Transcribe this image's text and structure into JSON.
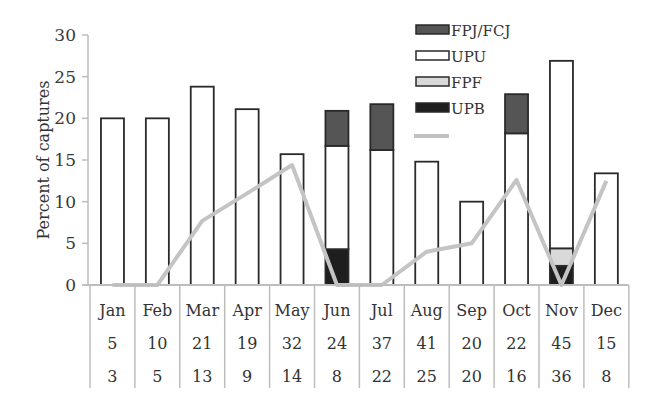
{
  "chart_data": {
    "type": "bar",
    "stacked": true,
    "title": "",
    "xlabel": "",
    "ylabel": "Percent of captures",
    "ylim": [
      0,
      30
    ],
    "yticks": [
      0,
      5,
      10,
      15,
      20,
      25,
      30
    ],
    "grid": false,
    "legend_position": "top-right (inside)",
    "categories": [
      "Jan",
      "Feb",
      "Mar",
      "Apr",
      "May",
      "Jun",
      "Jul",
      "Aug",
      "Sep",
      "Oct",
      "Nov",
      "Dec"
    ],
    "series": [
      {
        "name": "UPB",
        "kind": "bar",
        "color": "#1e1e1e",
        "values": [
          0,
          0,
          0,
          0,
          0,
          4.3,
          0,
          0,
          0,
          0,
          2.3,
          0
        ]
      },
      {
        "name": "FPF",
        "kind": "bar",
        "color": "#d9d9d9",
        "values": [
          0,
          0,
          0,
          0,
          0,
          0,
          0,
          0,
          0,
          0,
          2.1,
          0
        ]
      },
      {
        "name": "UPU",
        "kind": "bar",
        "color": "#ffffff",
        "values": [
          20.0,
          20.0,
          23.8,
          21.1,
          15.7,
          12.4,
          16.2,
          14.8,
          10.0,
          18.2,
          22.5,
          13.4
        ]
      },
      {
        "name": "FPJ/FCJ",
        "kind": "bar",
        "color": "#555555",
        "values": [
          0,
          0,
          0,
          0,
          0,
          4.2,
          5.5,
          0,
          0,
          4.7,
          0,
          0
        ]
      },
      {
        "name": "",
        "kind": "line",
        "color": "#c0c0c0",
        "values": [
          0,
          0,
          7.7,
          11.0,
          14.4,
          0,
          0,
          4.0,
          5.0,
          12.6,
          0,
          12.5
        ]
      }
    ],
    "table_rows": [
      [
        "5",
        "10",
        "21",
        "19",
        "32",
        "24",
        "37",
        "41",
        "20",
        "22",
        "45",
        "15"
      ],
      [
        "3",
        "5",
        "13",
        "9",
        "14",
        "8",
        "22",
        "25",
        "20",
        "16",
        "36",
        "8"
      ]
    ]
  },
  "legend": [
    {
      "label": "FPJ/FCJ",
      "fill": "#555555",
      "type": "box"
    },
    {
      "label": "UPU",
      "fill": "#ffffff",
      "type": "box"
    },
    {
      "label": "FPF",
      "fill": "#d9d9d9",
      "type": "box"
    },
    {
      "label": "UPB",
      "fill": "#1e1e1e",
      "type": "box"
    },
    {
      "label": "",
      "fill": "#c0c0c0",
      "type": "line"
    }
  ],
  "colors": {
    "axis": "#bdbdbd",
    "bar_stroke": "#2a2a2a",
    "line": "#c4c4c4"
  }
}
